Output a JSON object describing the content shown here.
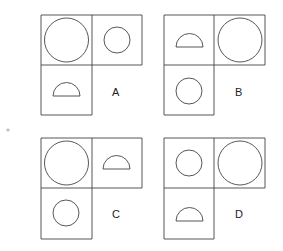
{
  "options": [
    {
      "label": "A",
      "cells": {
        "top_left": "large-circle",
        "top_right": "small-circle",
        "bottom_left": "semicircle"
      }
    },
    {
      "label": "B",
      "cells": {
        "top_left": "semicircle",
        "top_right": "large-circle",
        "bottom_left": "small-circle"
      }
    },
    {
      "label": "C",
      "cells": {
        "top_left": "large-circle",
        "top_right": "semicircle",
        "bottom_left": "small-circle"
      }
    },
    {
      "label": "D",
      "cells": {
        "top_left": "small-circle",
        "top_right": "large-circle",
        "bottom_left": "semicircle"
      }
    }
  ],
  "colors": {
    "stroke": "#444444",
    "background": "#ffffff",
    "dot": "#bbbbbb"
  }
}
